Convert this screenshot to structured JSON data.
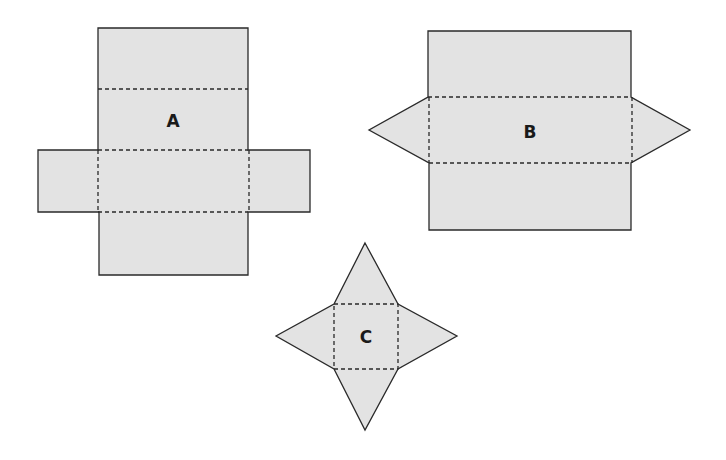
{
  "figure": {
    "colors": {
      "face_fill": "#e3e3e3",
      "edge_stroke": "#2a2a2a",
      "background": "#ffffff"
    },
    "nets": [
      {
        "label": "A",
        "shape": "rectangular prism net",
        "description": "Vertical strip of four rectangles with two rectangular side flaps"
      },
      {
        "label": "B",
        "shape": "triangular prism net",
        "description": "Three stacked rectangles with two triangular end flaps"
      },
      {
        "label": "C",
        "shape": "square pyramid net",
        "description": "Square base with four triangular faces"
      }
    ]
  }
}
